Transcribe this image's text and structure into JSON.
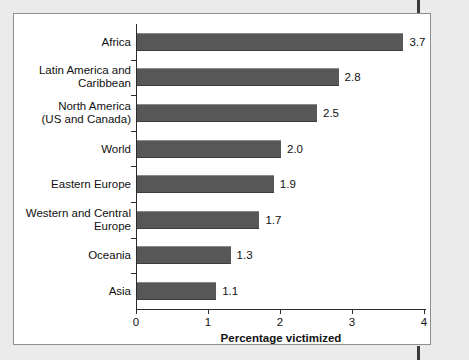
{
  "chart_data": {
    "type": "bar",
    "orientation": "horizontal",
    "title": "",
    "xlabel": "Percentage victimized",
    "ylabel": "",
    "xlim": [
      0,
      4
    ],
    "xticks": [
      "0",
      "1",
      "2",
      "3",
      "4"
    ],
    "grid": false,
    "legend": null,
    "categories": [
      "Africa",
      "Latin America and\nCaribbean",
      "North America\n(US and Canada)",
      "World",
      "Eastern Europe",
      "Western and Central\nEurope",
      "Oceania",
      "Asia"
    ],
    "values": [
      3.7,
      2.8,
      2.5,
      2.0,
      1.9,
      1.7,
      1.3,
      1.1
    ],
    "value_labels": [
      "3.7",
      "2.8",
      "2.5",
      "2.0",
      "1.9",
      "1.7",
      "1.3",
      "1.1"
    ],
    "bar_color": "#575757",
    "background_color": "#ffffff",
    "page_color": "#ebebeb",
    "axis_color": "#2b2b2b"
  }
}
